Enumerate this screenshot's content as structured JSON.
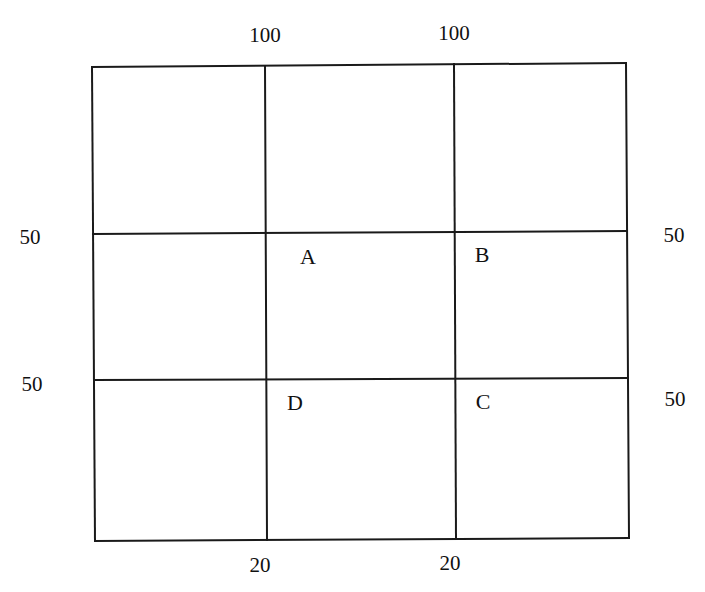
{
  "diagram": {
    "type": "grid",
    "top_labels": [
      {
        "id": "top-left",
        "text": "100"
      },
      {
        "id": "top-right",
        "text": "100"
      }
    ],
    "bottom_labels": [
      {
        "id": "bottom-left",
        "text": "20"
      },
      {
        "id": "bottom-right",
        "text": "20"
      }
    ],
    "left_labels": [
      {
        "id": "left-upper",
        "text": "50"
      },
      {
        "id": "left-lower",
        "text": "50"
      }
    ],
    "right_labels": [
      {
        "id": "right-upper",
        "text": "50"
      },
      {
        "id": "right-lower",
        "text": "50"
      }
    ],
    "nodes": [
      {
        "id": "A",
        "label": "A"
      },
      {
        "id": "B",
        "label": "B"
      },
      {
        "id": "C",
        "label": "C"
      },
      {
        "id": "D",
        "label": "D"
      }
    ],
    "line_color": "#1a1a1a",
    "background": "#ffffff"
  }
}
